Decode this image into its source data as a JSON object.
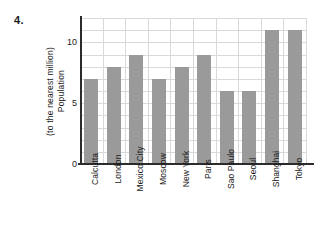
{
  "question_number": "4.",
  "chart_data": {
    "type": "bar",
    "title": "",
    "xlabel": "",
    "ylabel_lines": [
      "Population",
      "(to the nearest million)"
    ],
    "ylabel": "Population (to the nearest million)",
    "categories": [
      "Calcutta",
      "London",
      "Mexico City",
      "Moscow",
      "New York",
      "Paris",
      "Sao Paulo",
      "Seoul",
      "Shanghai",
      "Tokyo"
    ],
    "values": [
      7,
      8,
      9,
      7,
      8,
      9,
      6,
      6,
      11,
      11
    ],
    "ylim": [
      0,
      12
    ],
    "y_ticks_labeled": [
      0,
      5,
      10
    ],
    "y_tick_labels": [
      "0",
      "5",
      "10"
    ],
    "y_gridline_step": 1,
    "grid": true,
    "legend": "none",
    "bar_color": "#9a9a9a",
    "grid_color": "#d9d9d9",
    "axis_color": "#2b2b2b"
  }
}
